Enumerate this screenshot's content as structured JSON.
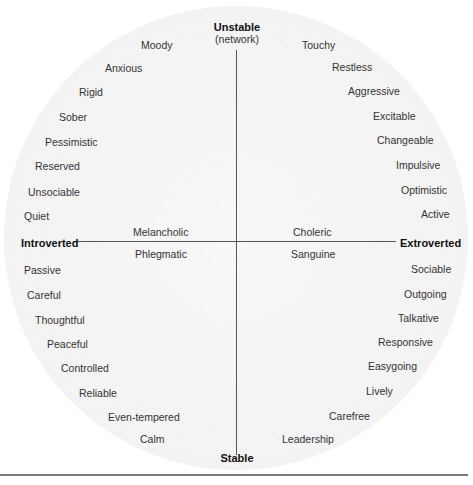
{
  "poles": {
    "top": "Unstable",
    "top_sub": "(network)",
    "bottom": "Stable",
    "left": "Introverted",
    "right": "Extroverted"
  },
  "temperaments": {
    "upper_left": "Melancholic",
    "lower_left": "Phlegmatic",
    "upper_right": "Choleric",
    "lower_right": "Sanguine"
  },
  "traits": {
    "upper_left": [
      "Moody",
      "Anxious",
      "Rigid",
      "Sober",
      "Pessimistic",
      "Reserved",
      "Unsociable",
      "Quiet"
    ],
    "upper_right": [
      "Touchy",
      "Restless",
      "Aggressive",
      "Excitable",
      "Changeable",
      "Impulsive",
      "Optimistic",
      "Active"
    ],
    "lower_left": [
      "Passive",
      "Careful",
      "Thoughtful",
      "Peaceful",
      "Controlled",
      "Reliable",
      "Even-tempered",
      "Calm"
    ],
    "lower_right": [
      "Sociable",
      "Outgoing",
      "Talkative",
      "Responsive",
      "Easygoing",
      "Lively",
      "Carefree",
      "Leadership"
    ]
  },
  "colors": {
    "disc": "#f3f3f3",
    "axis": "#555555",
    "text": "#333333"
  }
}
